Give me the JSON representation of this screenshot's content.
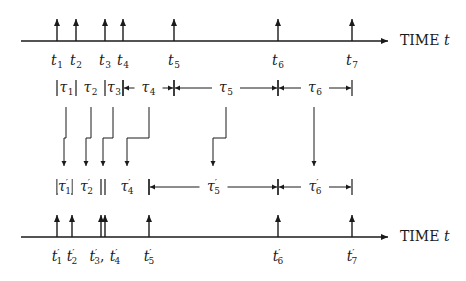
{
  "diagram": {
    "colors": {
      "line": "#1a1a1a",
      "background": "#ffffff"
    },
    "top_axis": {
      "label": "TIME",
      "variable": "t",
      "y": 41,
      "x_start": 21,
      "x_end": 388,
      "events": [
        {
          "name": "t",
          "sub": "1",
          "x": 57
        },
        {
          "name": "t",
          "sub": "2",
          "x": 76
        },
        {
          "name": "t",
          "sub": "3",
          "x": 105
        },
        {
          "name": "t",
          "sub": "4",
          "x": 123
        },
        {
          "name": "t",
          "sub": "5",
          "x": 174
        },
        {
          "name": "t",
          "sub": "6",
          "x": 278
        },
        {
          "name": "t",
          "sub": "7",
          "x": 352
        }
      ]
    },
    "top_intervals": {
      "y": 88,
      "items": [
        {
          "name": "τ",
          "sub": "1",
          "x1": 57,
          "x2": 76,
          "style": "bars"
        },
        {
          "name": "τ",
          "sub": "2",
          "x1": 76,
          "x2": 105,
          "style": "open"
        },
        {
          "name": "τ",
          "sub": "3",
          "x1": 105,
          "x2": 123,
          "style": "bars"
        },
        {
          "name": "τ",
          "sub": "4",
          "x1": 123,
          "x2": 174,
          "style": "arrows"
        },
        {
          "name": "τ",
          "sub": "5",
          "x1": 174,
          "x2": 278,
          "style": "arrows"
        },
        {
          "name": "τ",
          "sub": "6",
          "x1": 278,
          "x2": 352,
          "style": "arrows"
        }
      ]
    },
    "connectors": [
      {
        "from_x": 66,
        "to_x": 64
      },
      {
        "from_x": 91,
        "to_x": 86
      },
      {
        "from_x": 113,
        "to_x": 103
      },
      {
        "from_x": 149,
        "to_x": 127
      },
      {
        "from_x": 226,
        "to_x": 213
      },
      {
        "from_x": 314,
        "to_x": 314
      }
    ],
    "connector_geometry": {
      "y_start": 107,
      "y_jog": 138,
      "y_end": 166
    },
    "bottom_intervals": {
      "y": 187,
      "items": [
        {
          "name": "τ",
          "sub": "1",
          "prime": true,
          "x1": 57,
          "x2": 72,
          "style": "bars"
        },
        {
          "name": "τ",
          "sub": "2",
          "prime": true,
          "x1": 72,
          "x2": 101,
          "style": "open"
        },
        {
          "name": "",
          "sub": "",
          "prime": false,
          "x1": 101,
          "x2": 105,
          "style": "bars"
        },
        {
          "name": "τ",
          "sub": "4",
          "prime": true,
          "x1": 105,
          "x2": 149,
          "style": "open-right-bar"
        },
        {
          "name": "τ",
          "sub": "5",
          "prime": true,
          "x1": 149,
          "x2": 278,
          "style": "arrows"
        },
        {
          "name": "τ",
          "sub": "6",
          "prime": true,
          "x1": 278,
          "x2": 352,
          "style": "arrows"
        }
      ]
    },
    "bottom_axis": {
      "label": "TIME",
      "variable": "t",
      "y": 237,
      "x_start": 21,
      "x_end": 388,
      "events": [
        {
          "name": "t",
          "sub": "1",
          "prime": true,
          "x": 57
        },
        {
          "name": "t",
          "sub": "2",
          "prime": true,
          "x": 72
        },
        {
          "name": "t",
          "sub": "3",
          "prime": true,
          "x": 101
        },
        {
          "name": "t",
          "sub": "4",
          "prime": true,
          "x": 105
        },
        {
          "name": "t",
          "sub": "5",
          "prime": true,
          "x": 149
        },
        {
          "name": "t",
          "sub": "6",
          "prime": true,
          "x": 278
        },
        {
          "name": "t",
          "sub": "7",
          "prime": true,
          "x": 352
        }
      ],
      "combined_label_note": "t'3, t'4"
    },
    "labels": {
      "top_axis_text": "TIME",
      "top_axis_var": "t",
      "bottom_axis_text": "TIME",
      "bottom_axis_var": "t",
      "separator": ","
    }
  }
}
